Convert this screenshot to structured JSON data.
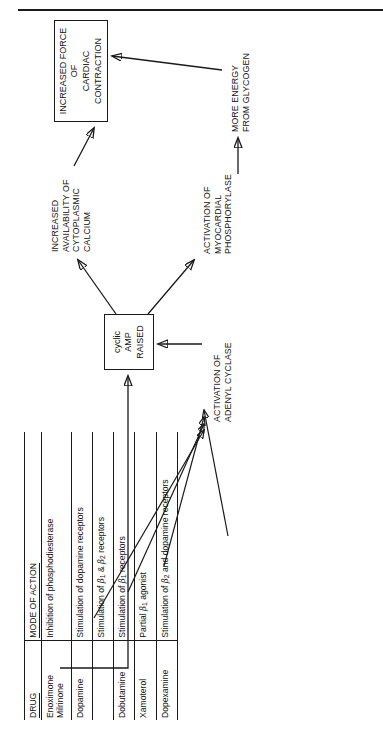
{
  "figure": {
    "top_rule": true,
    "orientation": "rotated-90-ccw"
  },
  "table": {
    "headers": {
      "drug": "DRUG",
      "mode": "MODE OF ACTION"
    },
    "rows": [
      {
        "drug_line1": "Enoximone",
        "drug_line2": "Milrinone",
        "mode_plain": "Inhibition of phosphodiesterase"
      },
      {
        "drug_line1": "Dopamine",
        "drug_line2": "",
        "mode_plain": "Stimulation of dopamine receptors"
      },
      {
        "drug_line1": "",
        "drug_line2": "",
        "mode_pre": "Stimulation of ",
        "mode_beta1": "β",
        "mode_sub1": "1",
        "mode_mid": " & ",
        "mode_beta2": "β",
        "mode_sub2": "2",
        "mode_post": " receptors"
      },
      {
        "drug_line1": "Dobutamine",
        "drug_line2": "",
        "mode_pre": "Stimulation of ",
        "mode_beta1": "β",
        "mode_sub1": "1",
        "mode_post": " receptors"
      },
      {
        "drug_line1": "Xamoterol",
        "drug_line2": "",
        "mode_pre": "Partial ",
        "mode_beta1": "β",
        "mode_sub1": "1",
        "mode_post": " agonist"
      },
      {
        "drug_line1": "Dopexamine",
        "drug_line2": "",
        "mode_pre": "Stimulation of ",
        "mode_beta1": "β",
        "mode_sub1": "2",
        "mode_post": " and dopamine receptors"
      }
    ]
  },
  "flow": {
    "cyclic_amp_box": {
      "line1": "cyclic",
      "line2": "AMP",
      "line3": "RAISED"
    },
    "adenyl_cyclase": {
      "line1": "ACTIVATION OF",
      "line2": "ADENYL CYCLASE"
    },
    "calcium": {
      "line1": "INCREASED",
      "line2": "AVAILABILITY OF",
      "line3": "CYTOPLASMIC",
      "line4": "CALCIUM"
    },
    "phosphorylase": {
      "line1": "ACTIVATION OF",
      "line2": "MYOCARDIAL",
      "line3": "PHOSPHORYLASE"
    },
    "glycogen": {
      "line1": "MORE ENERGY",
      "line2": "FROM GLYCOGEN"
    },
    "force_box": {
      "line1": "INCREASED FORCE OF",
      "line2": "CARDIAC CONTRACTION"
    }
  },
  "colors": {
    "ink": "#1a1a1a",
    "paper": "#ffffff"
  }
}
